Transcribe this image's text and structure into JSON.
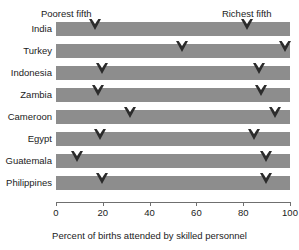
{
  "top_cut_text": "",
  "annotations": {
    "poorest": {
      "label": "Poorest fifth",
      "x_pct": 17.5
    },
    "richest": {
      "label": "Richest fifth",
      "x_pct": 82.0
    }
  },
  "axis": {
    "title": "Percent of births attended by skilled personnel",
    "ticks": [
      "0",
      "20",
      "40",
      "60",
      "80",
      "100"
    ],
    "gridlines": [
      20,
      40,
      60,
      80
    ]
  },
  "colors": {
    "bar": "#8d8d8d",
    "marker": "#2b2b2b",
    "grid": "#ffffff",
    "axis": "#6f6f6f",
    "text": "#1b1b1b",
    "background": "#ffffff"
  },
  "chart_data": {
    "type": "bar",
    "title": "",
    "subtitle": "",
    "xlabel": "Percent of births attended by skilled personnel",
    "ylabel": "",
    "xlim": [
      0,
      100
    ],
    "grid": true,
    "legend_position": "top-annotations",
    "categories": [
      "India",
      "Turkey",
      "Indonesia",
      "Zambia",
      "Cameroon",
      "Egypt",
      "Guatemala",
      "Philippines"
    ],
    "series": [
      {
        "name": "Poorest fifth",
        "values": [
          17,
          54,
          20,
          18,
          32,
          19,
          9,
          20
        ]
      },
      {
        "name": "Richest fifth",
        "values": [
          82,
          98,
          87,
          88,
          94,
          85,
          90,
          90
        ]
      }
    ],
    "annotations": [
      "Poorest fifth",
      "Richest fifth"
    ]
  }
}
